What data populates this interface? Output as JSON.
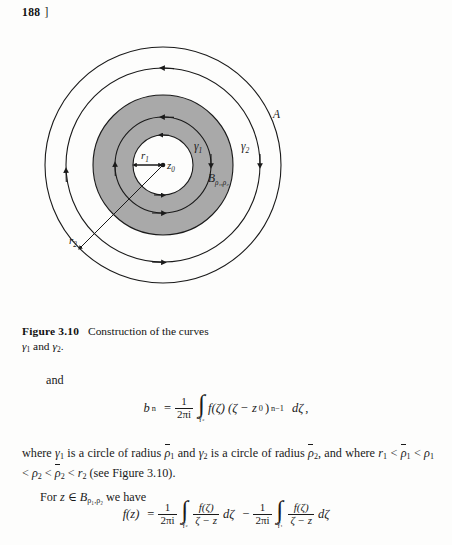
{
  "page": {
    "number": "188",
    "bracket": "]"
  },
  "figure": {
    "name": "figure-3-10",
    "labels": {
      "outer_region": "A",
      "gamma1": "γ",
      "gamma1_sub": "1",
      "gamma2": "γ",
      "gamma2_sub": "2",
      "annulus": "B",
      "annulus_sub": "ρ₁,ρ₂",
      "radius_inner": "r",
      "radius_inner_sub": "1",
      "radius_outer": "r",
      "radius_outer_sub": "2",
      "center": "z",
      "center_sub": "0"
    },
    "caption": {
      "title": "Figure 3.10",
      "text_part1": "Construction of the curves",
      "text_part2": "γ",
      "text_sub1": "1",
      "text_and": " and ",
      "text_part3": "γ",
      "text_sub2": "2",
      "text_period": "."
    },
    "colors": {
      "annulus_fill": "#a9a9a9",
      "stroke": "#1a1a1a",
      "page_background": "#fdfdfc"
    }
  },
  "content": {
    "lead_word": "and",
    "equation1": {
      "lhs": "b",
      "lhs_sub": "n",
      "equals": "=",
      "frac_num": "1",
      "frac_den": "2πi",
      "integral_limit": "γ₂",
      "integrand": "f(ζ) (ζ − z",
      "integrand_sub": "0",
      "integrand_close": ")",
      "exponent": "n−1",
      "differential": "dζ",
      "trailing": ","
    },
    "paragraph": {
      "line1_a": "where ",
      "gamma1": "γ",
      "gamma1_sub": "1",
      "line1_b": " is a circle of radius ",
      "rho1_bar": "ρ",
      "rho1_bar_sub": "1",
      "line1_c": " and ",
      "gamma2": "γ",
      "gamma2_sub": "2",
      "line1_d": " is a circle of radius ",
      "rho2_bar": "ρ",
      "rho2_bar_sub": "2",
      "line1_e": ", and",
      "line2_a": "where ",
      "r1": "r",
      "r1_sub": "1",
      "lt1": " < ",
      "rb1": "ρ",
      "rb1_sub": "1",
      "lt2": " < ",
      "p1": "ρ",
      "p1_sub": "1",
      "lt3": " < ",
      "p2": "ρ",
      "p2_sub": "2",
      "lt4": " < ",
      "rb2": "ρ",
      "rb2_sub": "2",
      "lt5": " < ",
      "r2": "r",
      "r2_sub": "2",
      "line2_b": " (see Figure 3.10).",
      "line3_a": "For ",
      "z": "z",
      "in": " ∈ ",
      "B": "B",
      "B_sub": "ρ₁,ρ₂",
      "line3_b": " we have"
    },
    "equation2": {
      "lhs": "f(z)",
      "equals": "=",
      "frac1_num": "1",
      "frac1_den": "2πi",
      "int1_limit": "γ₂",
      "int1_num": "f(ζ)",
      "int1_den": "ζ − z",
      "diff1": "dζ",
      "minus": "−",
      "frac2_num": "1",
      "frac2_den": "2πi",
      "int2_limit": "γ₁",
      "int2_num": "f(ζ)",
      "int2_den": "ζ − z",
      "diff2": "dζ"
    }
  }
}
